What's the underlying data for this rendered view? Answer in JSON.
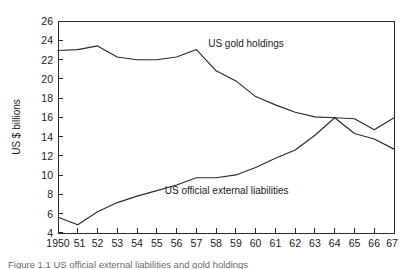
{
  "figure": {
    "caption": "Figure 1.1  US official external liabilities and gold holdings"
  },
  "axes": {
    "ylabel": "US $ billions",
    "xlabel": "",
    "y_ticks": [
      "26",
      "24",
      "22",
      "20",
      "18",
      "16",
      "14",
      "12",
      "10",
      "8",
      "6",
      "4"
    ],
    "x_ticks": [
      "1950",
      "51",
      "52",
      "53",
      "54",
      "55",
      "56",
      "57",
      "58",
      "59",
      "60",
      "61",
      "62",
      "63",
      "64",
      "65",
      "66",
      "67"
    ]
  },
  "labels": {
    "gold": "US gold holdings",
    "liabilities": "US official external liabilities"
  },
  "chart_data": {
    "type": "line",
    "title": "",
    "xlabel": "",
    "ylabel": "US $ billions",
    "xlim": [
      1950,
      1967
    ],
    "ylim": [
      3.0,
      26.0
    ],
    "grid": false,
    "legend": "inline-annotations",
    "x": [
      1950,
      1951,
      1952,
      1953,
      1954,
      1955,
      1956,
      1957,
      1958,
      1959,
      1960,
      1961,
      1962,
      1963,
      1964,
      1965,
      1966,
      1967
    ],
    "series": [
      {
        "name": "US gold holdings",
        "values": [
          22.8,
          22.9,
          23.3,
          22.1,
          21.8,
          21.8,
          22.1,
          22.9,
          20.6,
          19.5,
          17.8,
          16.9,
          16.1,
          15.6,
          15.5,
          13.8,
          13.2,
          12.1
        ],
        "label_position": {
          "x": 1957.6,
          "y": 23.2
        }
      },
      {
        "name": "US official external liabilities",
        "values": [
          4.7,
          3.9,
          5.3,
          6.3,
          7.0,
          7.6,
          8.2,
          9.0,
          9.0,
          9.3,
          10.1,
          11.1,
          12.0,
          13.6,
          15.5,
          15.4,
          14.2,
          15.5
        ],
        "label_position": {
          "x": 1955.4,
          "y": 7.2
        }
      }
    ]
  }
}
